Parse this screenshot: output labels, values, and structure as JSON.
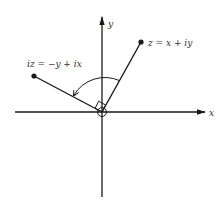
{
  "diagram": {
    "title": "",
    "axes": {
      "x_label": "x",
      "y_label": "y"
    },
    "points": [
      {
        "id": "z",
        "label": "z = x + iy"
      },
      {
        "id": "iz",
        "label": "iz = −y + ix"
      }
    ],
    "annotations": {
      "rotation": "90° counter-clockwise rotation arc",
      "right_angle": "right-angle marker at origin",
      "origin_marker": "circle at origin"
    },
    "colors": {
      "ink": "#1a1a1a",
      "background": "#ffffff"
    }
  }
}
